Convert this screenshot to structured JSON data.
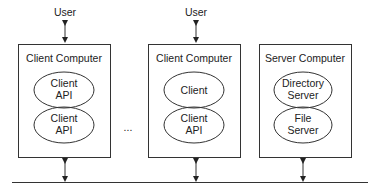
{
  "diagram": {
    "users": [
      {
        "label": "User"
      },
      {
        "label": "User"
      }
    ],
    "client_computer_1": {
      "title": "Client Computer",
      "top_ellipse": {
        "line1": "Client",
        "line2": "API"
      },
      "bottom_ellipse": {
        "line1": "Client",
        "line2": "API"
      }
    },
    "ellipsis": "...",
    "client_computer_2": {
      "title": "Client Computer",
      "top_ellipse": {
        "line1": "Client"
      },
      "bottom_ellipse": {
        "line1": "Client",
        "line2": "API"
      }
    },
    "server_computer": {
      "title": "Server Computer",
      "top_ellipse": {
        "line1": "Directory",
        "line2": "Server"
      },
      "bottom_ellipse": {
        "line1": "File",
        "line2": "Server"
      }
    },
    "network": {
      "label": ""
    },
    "colors": {
      "stroke": "#333333",
      "text": "#222222",
      "background": "#ffffff"
    }
  }
}
